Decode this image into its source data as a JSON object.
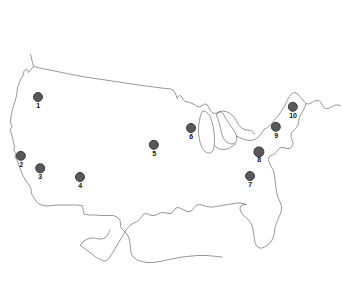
{
  "figure": {
    "type": "map",
    "region": "united-states",
    "background_color": "#ffffff",
    "outline_color": "#6b6b6b",
    "marker_fill_color": "#595959",
    "marker_edge_color": "#3d3d3d",
    "label_color": "#111111",
    "width": 342,
    "height": 283
  },
  "markers": [
    {
      "label": "1",
      "x": 38,
      "y": 97,
      "r": 5.0,
      "label_dy": 10
    },
    {
      "label": "2",
      "x": 21,
      "y": 156,
      "r": 5.2,
      "label_dy": 10
    },
    {
      "label": "3",
      "x": 40,
      "y": 168,
      "r": 4.8,
      "label_dy": 10
    },
    {
      "label": "4",
      "x": 80,
      "y": 177,
      "r": 5.0,
      "label_dy": 10
    },
    {
      "label": "5",
      "x": 154,
      "y": 145,
      "r": 5.2,
      "label_dy": 10
    },
    {
      "label": "6",
      "x": 191,
      "y": 128,
      "r": 5.0,
      "label_dy": 10
    },
    {
      "label": "7",
      "x": 250,
      "y": 176,
      "r": 5.0,
      "label_dy": 10
    },
    {
      "label": "8",
      "x": 259,
      "y": 152,
      "r": 5.6,
      "label_dy": 10
    },
    {
      "label": "9",
      "x": 276,
      "y": 127,
      "r": 5.2,
      "label_dy": 10
    },
    {
      "label": "10",
      "x": 293,
      "y": 107,
      "r": 5.2,
      "label_dy": 10
    }
  ]
}
